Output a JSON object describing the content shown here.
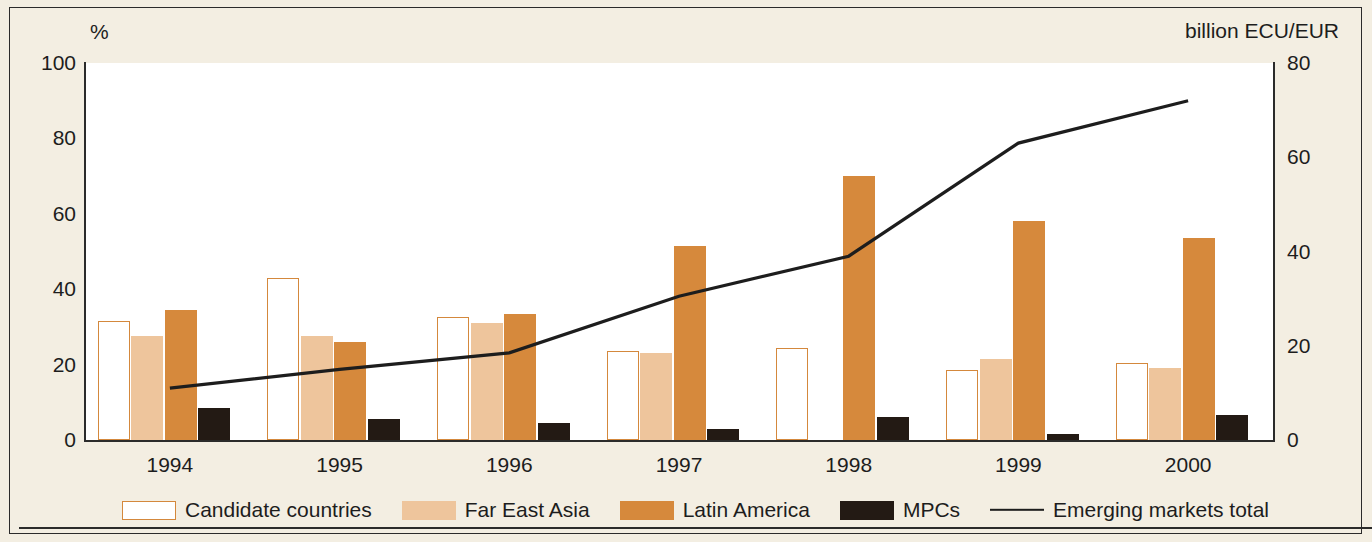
{
  "axes": {
    "left_unit": "%",
    "right_unit": "billion ECU/EUR",
    "left_ticks": [
      "100",
      "80",
      "60",
      "40",
      "20",
      "0"
    ],
    "right_ticks": [
      "80",
      "60",
      "40",
      "20",
      "0"
    ]
  },
  "legend": {
    "items": [
      {
        "label": "Candidate countries",
        "key": "candidate",
        "color": "#ffffff"
      },
      {
        "label": "Far East Asia",
        "key": "fareast",
        "color": "#eec59c"
      },
      {
        "label": "Latin America",
        "key": "latin",
        "color": "#d6893c"
      },
      {
        "label": "MPCs",
        "key": "mpc",
        "color": "#231a14"
      },
      {
        "label": "Emerging markets total",
        "key": "line",
        "color": "#1d1d1d"
      }
    ]
  },
  "chart_data": {
    "type": "bar",
    "title": "",
    "xlabel": "",
    "ylabel": "%",
    "y2label": "billion ECU/EUR",
    "categories": [
      "1994",
      "1995",
      "1996",
      "1997",
      "1998",
      "1999",
      "2000"
    ],
    "ylim": [
      0,
      100
    ],
    "y2lim": [
      0,
      80
    ],
    "grid": false,
    "legend_position": "bottom",
    "series": [
      {
        "name": "Candidate countries",
        "axis": "left",
        "color": "#ffffff",
        "values": [
          31.5,
          43.0,
          32.5,
          23.5,
          24.5,
          18.5,
          20.5
        ]
      },
      {
        "name": "Far East Asia",
        "axis": "left",
        "color": "#eec59c",
        "values": [
          27.5,
          27.5,
          31.0,
          23.0,
          0.0,
          21.5,
          19.0
        ]
      },
      {
        "name": "Latin America",
        "axis": "left",
        "color": "#d6893c",
        "values": [
          34.5,
          26.0,
          33.5,
          51.5,
          70.0,
          58.0,
          53.5
        ]
      },
      {
        "name": "MPCs",
        "axis": "left",
        "color": "#231a14",
        "values": [
          8.5,
          5.5,
          4.5,
          3.0,
          6.0,
          1.5,
          6.5
        ]
      },
      {
        "name": "Emerging markets total",
        "axis": "right",
        "type": "line",
        "color": "#1d1d1d",
        "values": [
          11.0,
          15.0,
          18.5,
          30.5,
          39.0,
          63.0,
          72.0
        ]
      }
    ]
  }
}
